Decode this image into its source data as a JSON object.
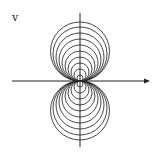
{
  "diagram": {
    "type": "family-of-tangent-circles",
    "axis_label_vertical": "v",
    "colors": {
      "stroke": "#333333",
      "axis": "#222222",
      "background": "#ffffff"
    },
    "origin": {
      "x": 80,
      "y": 81
    },
    "horizontal_axis": {
      "x1": 12,
      "x2": 150,
      "arrow": true
    },
    "vertical_axis": {
      "y1": 13,
      "y2": 147,
      "arrow": false
    },
    "circle_radii": [
      3,
      6,
      9,
      12,
      15,
      18,
      21,
      24,
      27,
      29.5
    ],
    "sides": [
      "above",
      "below"
    ]
  }
}
